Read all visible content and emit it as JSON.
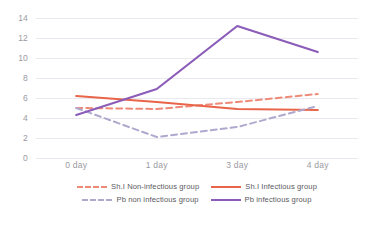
{
  "chart_data": {
    "type": "line",
    "title": "",
    "xlabel": "",
    "ylabel": "",
    "categories": [
      "0 day",
      "1 day",
      "3 day",
      "4 day"
    ],
    "ylim": [
      0,
      14
    ],
    "yticks": [
      0,
      2,
      4,
      6,
      8,
      10,
      12,
      14
    ],
    "grid": true,
    "legend_position": "bottom",
    "series": [
      {
        "name": "Sh.I Non-infectious group",
        "values": [
          5.0,
          4.9,
          5.6,
          6.4
        ],
        "color": "#ED8A78",
        "style": "dashed"
      },
      {
        "name": "Sh.I Infectious group",
        "values": [
          6.2,
          5.6,
          4.9,
          4.8
        ],
        "color": "#E8654A",
        "style": "solid"
      },
      {
        "name": "Pb non infectious group",
        "values": [
          5.0,
          2.1,
          3.1,
          5.2
        ],
        "color": "#AFA9CE",
        "style": "dashed"
      },
      {
        "name": "Pb infectious group",
        "values": [
          4.3,
          6.9,
          13.2,
          10.6
        ],
        "color": "#8B5CB8",
        "style": "solid"
      }
    ]
  },
  "axes": {
    "y_tick_labels": [
      "14",
      "12",
      "10",
      "8",
      "6",
      "4",
      "2",
      "0"
    ],
    "x_tick_labels": [
      "0 day",
      "1 day",
      "3 day",
      "4 day"
    ]
  },
  "legend": {
    "rows": [
      [
        {
          "label": "Sh.I Non-infectious group",
          "color": "#ED8A78",
          "style": "dashed"
        },
        {
          "label": "Sh.I Infectious group",
          "color": "#E8654A",
          "style": "solid"
        }
      ],
      [
        {
          "label": "Pb non infectious group",
          "color": "#AFA9CE",
          "style": "dashed"
        },
        {
          "label": "Pb infectious group",
          "color": "#8B5CB8",
          "style": "solid"
        }
      ]
    ]
  },
  "colors": {
    "gridline": "#e9e9ef",
    "tick_text": "#9a9aa2",
    "legend_text": "#5a5a62",
    "background": "#ffffff"
  }
}
